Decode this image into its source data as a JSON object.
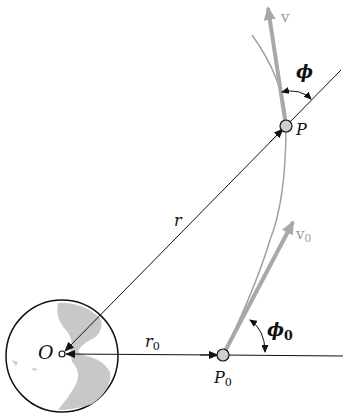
{
  "diagram": {
    "points": {
      "origin": {
        "label": "O",
        "x": 62,
        "y": 354
      },
      "initial": {
        "label": "P",
        "sub": "0",
        "x": 223,
        "y": 355
      },
      "current": {
        "label": "P",
        "x": 286,
        "y": 126
      }
    },
    "vectors": {
      "r": {
        "label": "r"
      },
      "r0": {
        "label": "r",
        "sub": "0"
      },
      "v": {
        "label": "v"
      },
      "v0": {
        "label": "v",
        "sub": "0"
      }
    },
    "angles": {
      "phi": {
        "label": "ϕ"
      },
      "phi0": {
        "label": "ϕ",
        "sub": "0"
      }
    },
    "colors": {
      "line": "#111111",
      "velocity": "#a8a8a8",
      "trajectory": "#a0a0a0",
      "land": "#c8c8c8",
      "point_fill": "#cfcfcf"
    }
  }
}
